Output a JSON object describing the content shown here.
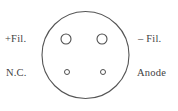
{
  "diagram": {
    "kind": "tube-socket-pin-diagram",
    "colors": {
      "background": "#ffffff",
      "stroke": "#555555",
      "text": "#3f3f3f"
    },
    "envelope": {
      "shape": "circle",
      "center_x": 85.5,
      "center_y": 55,
      "radius": 43.5,
      "stroke_width": 1.1
    },
    "pins": [
      {
        "id": "pin-upper-left",
        "label": "+Fil.",
        "label_side": "left",
        "cx": 66,
        "cy": 39,
        "r": 5.0,
        "size": "large"
      },
      {
        "id": "pin-upper-right",
        "label": "– Fil.",
        "label_side": "right",
        "cx": 102,
        "cy": 39,
        "r": 5.0,
        "size": "large"
      },
      {
        "id": "pin-lower-left",
        "label": "N.C.",
        "label_side": "left",
        "cx": 67,
        "cy": 72,
        "r": 2.5,
        "size": "small"
      },
      {
        "id": "pin-lower-right",
        "label": "Anode",
        "label_side": "right",
        "cx": 103,
        "cy": 72,
        "r": 2.5,
        "size": "small"
      }
    ],
    "labels": {
      "plus_fil": "+Fil.",
      "minus_fil": "– Fil.",
      "nc": "N.C.",
      "anode": "Anode"
    }
  }
}
